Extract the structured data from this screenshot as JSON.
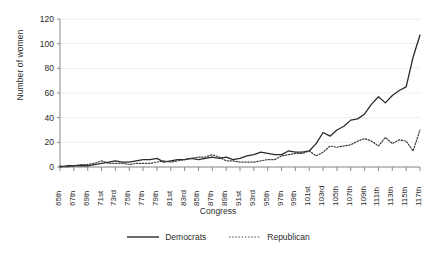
{
  "chart_data": {
    "type": "line",
    "title": "",
    "xlabel": "Congress",
    "ylabel": "Number of women",
    "ylim": [
      0,
      120
    ],
    "yticks": [
      0,
      20,
      40,
      60,
      80,
      100,
      120
    ],
    "grid": true,
    "legend_position": "bottom",
    "categories": [
      "65th",
      "66th",
      "67th",
      "68th",
      "69th",
      "70th",
      "71st",
      "72nd",
      "73rd",
      "74th",
      "75th",
      "76th",
      "77th",
      "78th",
      "79th",
      "80th",
      "81st",
      "82nd",
      "83rd",
      "84th",
      "85th",
      "86th",
      "87th",
      "88th",
      "89th",
      "90th",
      "91st",
      "92nd",
      "93rd",
      "94th",
      "95th",
      "96th",
      "97th",
      "98th",
      "99th",
      "100th",
      "101st",
      "102nd",
      "103rd",
      "104th",
      "105th",
      "106th",
      "107th",
      "108th",
      "109th",
      "110th",
      "111th",
      "112th",
      "113th",
      "114th",
      "115th",
      "116th",
      "117th"
    ],
    "xtick_labels": [
      "65th",
      "67th",
      "69th",
      "71st",
      "73rd",
      "75th",
      "77th",
      "79th",
      "81st",
      "83rd",
      "85th",
      "87th",
      "89th",
      "91st",
      "93rd",
      "95th",
      "97th",
      "99th",
      "101st",
      "103rd",
      "105th",
      "107th",
      "109th",
      "111th",
      "113th",
      "115th",
      "117th"
    ],
    "series": [
      {
        "name": "Democrats",
        "style": "solid",
        "color": "#2b2b2b",
        "values": [
          0,
          1,
          1,
          1,
          1,
          2,
          3,
          4,
          5,
          4,
          4,
          5,
          6,
          6,
          7,
          4,
          5,
          6,
          6,
          7,
          6,
          7,
          8,
          7,
          8,
          6,
          7,
          9,
          10,
          12,
          11,
          10,
          10,
          13,
          12,
          12,
          13,
          19,
          28,
          25,
          30,
          33,
          38,
          39,
          43,
          51,
          57,
          52,
          58,
          62,
          65,
          89,
          107
        ]
      },
      {
        "name": "Republican",
        "style": "dotted",
        "color": "#3a3a3a",
        "values": [
          1,
          0,
          1,
          2,
          2,
          3,
          5,
          3,
          3,
          3,
          2,
          3,
          3,
          3,
          4,
          5,
          4,
          5,
          6,
          7,
          8,
          8,
          10,
          8,
          5,
          5,
          4,
          4,
          4,
          5,
          6,
          6,
          9,
          10,
          11,
          11,
          13,
          9,
          12,
          17,
          16,
          17,
          18,
          21,
          23,
          21,
          17,
          24,
          19,
          22,
          21,
          13,
          30
        ]
      }
    ]
  },
  "legend": {
    "items": [
      {
        "label": "Democrats",
        "style": "solid"
      },
      {
        "label": "Republican",
        "style": "dotted"
      }
    ]
  }
}
